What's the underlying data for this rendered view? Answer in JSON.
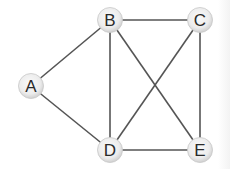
{
  "diagram": {
    "type": "undirected-graph",
    "colors": {
      "edge": "#555555",
      "node_fill_center": "#f8f8f8",
      "node_fill_edge": "#d4d4d4",
      "label": "#2a2a2a"
    },
    "nodes": [
      {
        "id": "A",
        "label": "A",
        "x": 31,
        "y": 86
      },
      {
        "id": "B",
        "label": "B",
        "x": 110,
        "y": 20
      },
      {
        "id": "C",
        "label": "C",
        "x": 200,
        "y": 20
      },
      {
        "id": "D",
        "label": "D",
        "x": 110,
        "y": 150
      },
      {
        "id": "E",
        "label": "E",
        "x": 200,
        "y": 150
      }
    ],
    "edges": [
      {
        "from": "A",
        "to": "B"
      },
      {
        "from": "A",
        "to": "D"
      },
      {
        "from": "B",
        "to": "C"
      },
      {
        "from": "B",
        "to": "D"
      },
      {
        "from": "B",
        "to": "E"
      },
      {
        "from": "C",
        "to": "D"
      },
      {
        "from": "C",
        "to": "E"
      },
      {
        "from": "D",
        "to": "E"
      }
    ]
  }
}
